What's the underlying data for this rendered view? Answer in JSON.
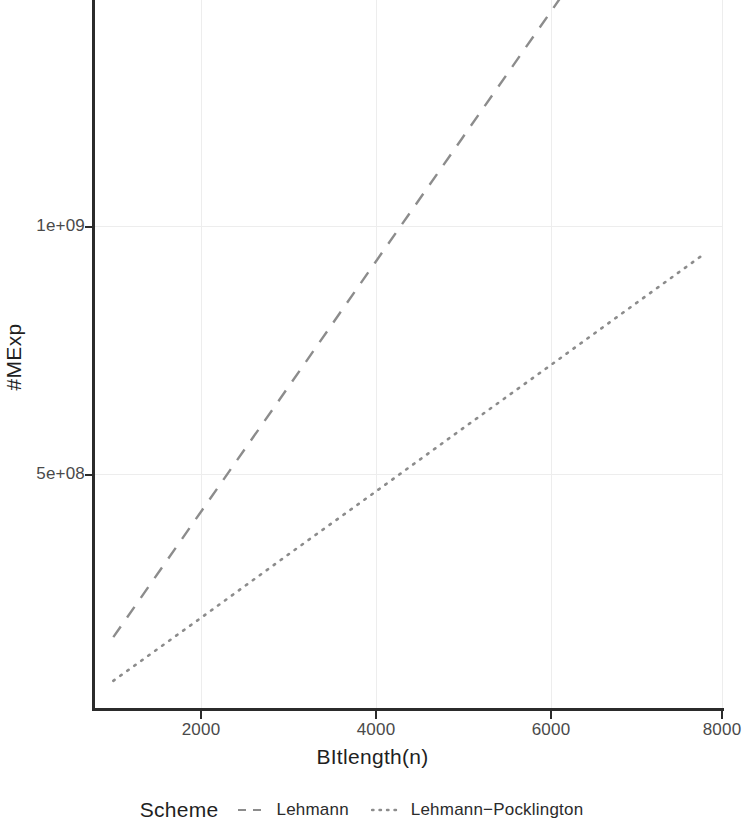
{
  "chart_data": {
    "type": "line",
    "title": "",
    "xlabel": "BItlength(n)",
    "ylabel": "#MExp",
    "xlim": [
      800,
      8100
    ],
    "ylim": [
      0,
      2050000000
    ],
    "grid": true,
    "xticks": [
      2000,
      4000,
      6000,
      8000
    ],
    "xticklabels": [
      "2000",
      "4000",
      "6000",
      "8000"
    ],
    "yticks": [
      500000000,
      1000000000
    ],
    "yticklabels": [
      "5e+08",
      "1e+09"
    ],
    "legend": {
      "title": "Scheme",
      "position": "bottom",
      "entries": [
        {
          "name": "Lehmann",
          "dash": "dashed",
          "color": "#8c8c8c"
        },
        {
          "name": "Lehmann−Pocklington",
          "dash": "dotted",
          "color": "#8c8c8c"
        }
      ]
    },
    "series": [
      {
        "name": "Lehmann",
        "dash": "dashed",
        "color": "#8c8c8c",
        "x": [
          990,
          2000,
          3000,
          4000,
          5000,
          6000,
          7000,
          7790
        ],
        "y": [
          171000000,
          424000000,
          674000000,
          925000000,
          1175000000,
          1425000000,
          1676000000,
          1874000000
        ]
      },
      {
        "name": "Lehmann−Pocklington",
        "dash": "dotted",
        "color": "#8c8c8c",
        "x": [
          990,
          2000,
          3000,
          4000,
          5000,
          6000,
          7000,
          7790
        ],
        "y": [
          83000000,
          210000000,
          337000000,
          463000000,
          590000000,
          716000000,
          843000000,
          943000000
        ]
      }
    ]
  },
  "axis": {
    "x_title": "BItlength(n)",
    "y_title": "#MExp"
  },
  "legend": {
    "title": "Scheme",
    "items": [
      {
        "label": "Lehmann"
      },
      {
        "label": "Lehmann−Pocklington"
      }
    ]
  }
}
